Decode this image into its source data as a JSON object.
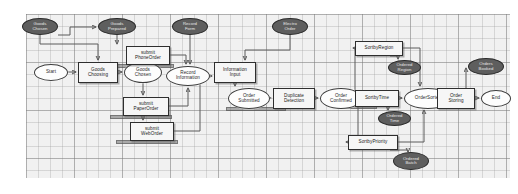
{
  "diagram": {
    "canvas": {
      "grid": "on",
      "background": "#f1f1f1",
      "grid_color": "#9a9a9a"
    },
    "legend": {
      "state_shape": "ellipse-white",
      "action_shape": "rectangle",
      "event_shape": "ellipse-filled",
      "accent": "#5e5e5e"
    },
    "nodes": [
      {
        "id": "ev_goods_chosen",
        "label": "Goods\nChosen",
        "type": "event",
        "x": 22,
        "y": 18,
        "w": 36,
        "h": 17
      },
      {
        "id": "ev_goods_prepared",
        "label": "Goods\nPrepared",
        "type": "event",
        "x": 98,
        "y": 18,
        "w": 38,
        "h": 17
      },
      {
        "id": "ev_record_form",
        "label": "Record\nForm",
        "type": "event",
        "x": 172,
        "y": 18,
        "w": 36,
        "h": 17
      },
      {
        "id": "ev_electro_order",
        "label": "Electro\nOrder",
        "type": "event",
        "x": 272,
        "y": 18,
        "w": 36,
        "h": 17
      },
      {
        "id": "st_start",
        "label": "Start",
        "type": "state",
        "x": 34,
        "y": 64,
        "w": 34,
        "h": 17
      },
      {
        "id": "ac_goods_choosing",
        "label": "Goods\nChoosing",
        "type": "action",
        "x": 78,
        "y": 62,
        "w": 40,
        "h": 21
      },
      {
        "id": "st_goods_chosen",
        "label": "Goods\nChosen",
        "type": "state",
        "x": 124,
        "y": 62,
        "w": 38,
        "h": 21
      },
      {
        "id": "ac_submit_phone",
        "label": "submit\nPhoneOrder",
        "type": "action",
        "x": 126,
        "y": 46,
        "w": 44,
        "h": 19
      },
      {
        "id": "ac_submit_paper",
        "label": "submit\nPaperOrder",
        "type": "action",
        "x": 123,
        "y": 97,
        "w": 46,
        "h": 19
      },
      {
        "id": "ac_submit_web",
        "label": "submit\nWebOrder",
        "type": "action",
        "x": 130,
        "y": 122,
        "w": 44,
        "h": 19
      },
      {
        "id": "st_record_info",
        "label": "Record\nInformation",
        "type": "state",
        "x": 166,
        "y": 66,
        "w": 44,
        "h": 20
      },
      {
        "id": "ac_info_input",
        "label": "Information\nInput",
        "type": "action",
        "x": 214,
        "y": 62,
        "w": 42,
        "h": 21
      },
      {
        "id": "st_order_submitted",
        "label": "Order\nSubmitted",
        "type": "state",
        "x": 228,
        "y": 88,
        "w": 42,
        "h": 21
      },
      {
        "id": "ac_dup_detection",
        "label": "Duplicate\nDetection",
        "type": "action",
        "x": 273,
        "y": 88,
        "w": 42,
        "h": 21
      },
      {
        "id": "st_order_confirmed",
        "label": "Order\nConfirmed",
        "type": "state",
        "x": 320,
        "y": 88,
        "w": 42,
        "h": 21
      },
      {
        "id": "ac_sort_region",
        "label": "SortbyRegion",
        "type": "action",
        "x": 355,
        "y": 41,
        "w": 48,
        "h": 15
      },
      {
        "id": "ev_ordered_region",
        "label": "Ordered\nRegion",
        "type": "event",
        "x": 388,
        "y": 60,
        "w": 33,
        "h": 15
      },
      {
        "id": "ac_sort_time",
        "label": "SortbyTime",
        "type": "action",
        "x": 355,
        "y": 90,
        "w": 44,
        "h": 17
      },
      {
        "id": "ev_ordered_time",
        "label": "Ordered\nTime",
        "type": "event",
        "x": 378,
        "y": 111,
        "w": 33,
        "h": 15
      },
      {
        "id": "ac_sort_priority",
        "label": "SortbyPriority",
        "type": "action",
        "x": 348,
        "y": 135,
        "w": 50,
        "h": 15
      },
      {
        "id": "ev_ordered_batch",
        "label": "Ordered\nBatch",
        "type": "event",
        "x": 393,
        "y": 152,
        "w": 36,
        "h": 18
      },
      {
        "id": "st_order_sorted",
        "label": "OrderSorted",
        "type": "state",
        "x": 404,
        "y": 88,
        "w": 48,
        "h": 21
      },
      {
        "id": "ac_order_storing",
        "label": "Order\nStoring",
        "type": "action",
        "x": 437,
        "y": 88,
        "w": 38,
        "h": 21
      },
      {
        "id": "ev_order_booked",
        "label": "Orders\nBooked",
        "type": "event",
        "x": 468,
        "y": 58,
        "w": 36,
        "h": 17
      },
      {
        "id": "st_end",
        "label": "End",
        "type": "state",
        "x": 481,
        "y": 90,
        "w": 30,
        "h": 17
      }
    ]
  }
}
